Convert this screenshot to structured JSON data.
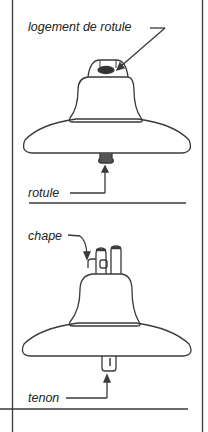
{
  "diagram": {
    "type": "insulator-parts",
    "panels": [
      {
        "title": "ball-and-socket insulator",
        "labels": [
          {
            "id": "logement",
            "text": "logement de rotule"
          },
          {
            "id": "rotule",
            "text": "rotule"
          }
        ]
      },
      {
        "title": "clevis-and-tongue insulator",
        "labels": [
          {
            "id": "chape",
            "text": "chape"
          },
          {
            "id": "tenon",
            "text": "tenon"
          }
        ]
      }
    ],
    "colors": {
      "line": "#3a3a3a",
      "background": "#ffffff"
    }
  }
}
